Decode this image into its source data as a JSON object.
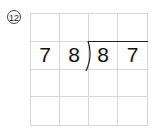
{
  "problem": {
    "number_label": "12",
    "divisor": "78",
    "dividend": "87",
    "grid": {
      "rows": 4,
      "cols": 4,
      "cells": [
        [
          "",
          "",
          "",
          ""
        ],
        [
          "7",
          "8",
          "8",
          "7"
        ],
        [
          "",
          "",
          "",
          ""
        ],
        [
          "",
          "",
          "",
          ""
        ]
      ]
    }
  }
}
